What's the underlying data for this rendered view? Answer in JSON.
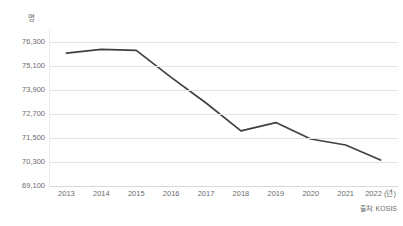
{
  "chart_data": {
    "type": "line",
    "title": "",
    "subtitle": "",
    "xlabel": "(년)",
    "ylabel": "명",
    "unit_label": "명",
    "x_axis_suffix": "(년)",
    "categories": [
      "2013",
      "2014",
      "2015",
      "2016",
      "2017",
      "2018",
      "2019",
      "2020",
      "2021",
      "2022"
    ],
    "values": [
      75740,
      75930,
      75880,
      74530,
      73250,
      71860,
      72270,
      71450,
      71150,
      70400
    ],
    "series": [
      {
        "name": "",
        "values": [
          75740,
          75930,
          75880,
          74530,
          73250,
          71860,
          72270,
          71450,
          71150,
          70400
        ]
      }
    ],
    "ylim": [
      69100,
      76900
    ],
    "ytick_values": [
      76300,
      75100,
      73900,
      72700,
      71500,
      70300,
      69100
    ],
    "ytick_labels": [
      "76,300",
      "75,100",
      "73,900",
      "72,700",
      "71,500",
      "70,300",
      "69,100"
    ],
    "ytick_interval": 1200,
    "grid": true,
    "grid_axis": "y",
    "legend": false,
    "legend_position": "none",
    "line_color": "#404040",
    "grid_color": "#e4e4e4",
    "text_color": "#6b6b6b",
    "background_color": "#ffffff",
    "markers": false,
    "annotations": []
  },
  "source": {
    "label": "출처: KOSIS"
  },
  "x_labels_display": [
    "2013",
    "2014",
    "2015",
    "2016",
    "2017",
    "2018",
    "2019",
    "2020",
    "2021",
    "2022 (년)"
  ]
}
